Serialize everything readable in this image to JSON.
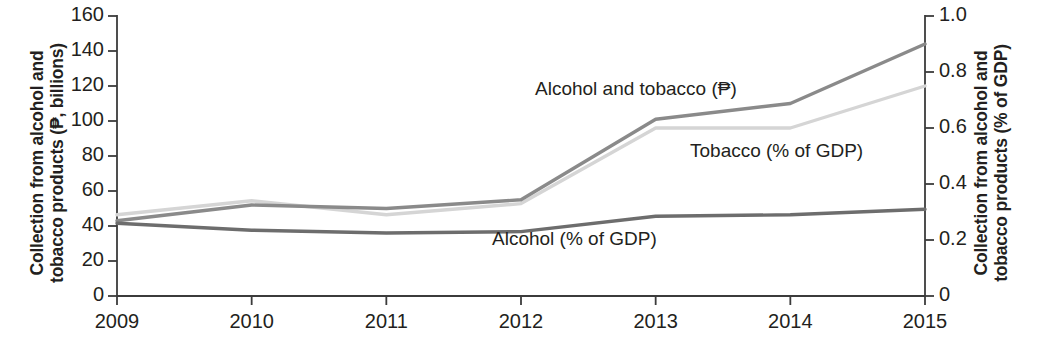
{
  "chart_data": {
    "type": "line",
    "title": "",
    "x": [
      2009,
      2010,
      2011,
      2012,
      2013,
      2014,
      2015
    ],
    "categories": [
      "2009",
      "2010",
      "2011",
      "2012",
      "2013",
      "2014",
      "2015"
    ],
    "series": [
      {
        "name": "Alcohol and tobacco (₱)",
        "axis": "left",
        "unit": "₱ billions",
        "color": "#8a8a8a",
        "values": [
          43,
          52,
          50,
          55,
          101,
          110,
          144
        ],
        "label_x": 535,
        "label_y": 78
      },
      {
        "name": "Tobacco (% of GDP)",
        "axis": "right",
        "unit": "% of GDP",
        "color": "#d5d5d5",
        "values": [
          0.29,
          0.34,
          0.29,
          0.33,
          0.6,
          0.6,
          0.75
        ],
        "label_x": 690,
        "label_y": 140
      },
      {
        "name": "Alcohol (% of GDP)",
        "axis": "right",
        "unit": "% of GDP",
        "color": "#6d6d6d",
        "values": [
          0.26,
          0.235,
          0.225,
          0.23,
          0.285,
          0.29,
          0.31
        ],
        "label_x": 492,
        "label_y": 228
      }
    ],
    "left_axis": {
      "label_line1": "Collection from alcohol and",
      "label_line2": "tobacco products (₱, billions)",
      "ticks": [
        "0",
        "20",
        "40",
        "60",
        "80",
        "100",
        "120",
        "140",
        "160"
      ],
      "tick_values": [
        0,
        20,
        40,
        60,
        80,
        100,
        120,
        140,
        160
      ],
      "min": 0,
      "max": 160
    },
    "right_axis": {
      "label_line1": "Collection from alcohol and",
      "label_line2": "tobacco products (% of GDP)",
      "ticks": [
        "0",
        "0.2",
        "0.4",
        "0.6",
        "0.8",
        "1.0"
      ],
      "tick_values": [
        0,
        0.2,
        0.4,
        0.6,
        0.8,
        1.0
      ],
      "min": 0,
      "max": 1.0
    },
    "x_axis": {
      "label": "",
      "ticks": [
        "2009",
        "2010",
        "2011",
        "2012",
        "2013",
        "2014",
        "2015"
      ],
      "min": 2009,
      "max": 2015
    },
    "grid": false,
    "legend": "inline-annotations"
  }
}
